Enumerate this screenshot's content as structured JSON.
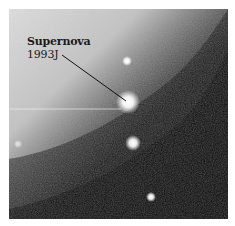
{
  "image": {
    "subject": "Astronomical photograph of galaxy field",
    "annotation": {
      "line1": "Supernova",
      "line2": "1993J"
    },
    "colors": {
      "bright_region": "#c8c8c8",
      "dark_region": "#0a0a0a",
      "star": "#ffffff",
      "label_text": "#1a1a1a",
      "background": "#ffffff"
    }
  }
}
